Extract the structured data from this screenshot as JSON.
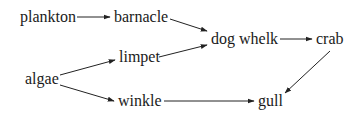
{
  "diagram": {
    "type": "food-web",
    "colors": {
      "text": "#1a1a1a",
      "arrow": "#222222",
      "background": "#ffffff"
    },
    "nodes": [
      {
        "id": "plankton",
        "label": "plankton",
        "x": 20,
        "y": 22
      },
      {
        "id": "barnacle",
        "label": "barnacle",
        "x": 114,
        "y": 22
      },
      {
        "id": "limpet",
        "label": "limpet",
        "x": 119,
        "y": 62
      },
      {
        "id": "dog_whelk",
        "label": "dog whelk",
        "x": 211,
        "y": 44
      },
      {
        "id": "crab",
        "label": "crab",
        "x": 316,
        "y": 44
      },
      {
        "id": "algae",
        "label": "algae",
        "x": 25,
        "y": 84
      },
      {
        "id": "winkle",
        "label": "winkle",
        "x": 118,
        "y": 106
      },
      {
        "id": "gull",
        "label": "gull",
        "x": 258,
        "y": 106
      }
    ],
    "edges": [
      {
        "from": "plankton",
        "to": "barnacle",
        "x1": 77,
        "y1": 17,
        "x2": 110,
        "y2": 17
      },
      {
        "from": "barnacle",
        "to": "dog_whelk",
        "x1": 170,
        "y1": 19,
        "x2": 207,
        "y2": 31
      },
      {
        "from": "limpet",
        "to": "dog_whelk",
        "x1": 159,
        "y1": 57,
        "x2": 207,
        "y2": 45
      },
      {
        "from": "dog_whelk",
        "to": "crab",
        "x1": 280,
        "y1": 39,
        "x2": 312,
        "y2": 39
      },
      {
        "from": "algae",
        "to": "limpet",
        "x1": 60,
        "y1": 75,
        "x2": 115,
        "y2": 60
      },
      {
        "from": "algae",
        "to": "winkle",
        "x1": 60,
        "y1": 85,
        "x2": 114,
        "y2": 101
      },
      {
        "from": "winkle",
        "to": "gull",
        "x1": 164,
        "y1": 101,
        "x2": 254,
        "y2": 101
      },
      {
        "from": "crab",
        "to": "gull",
        "x1": 330,
        "y1": 51,
        "x2": 285,
        "y2": 93
      }
    ]
  }
}
